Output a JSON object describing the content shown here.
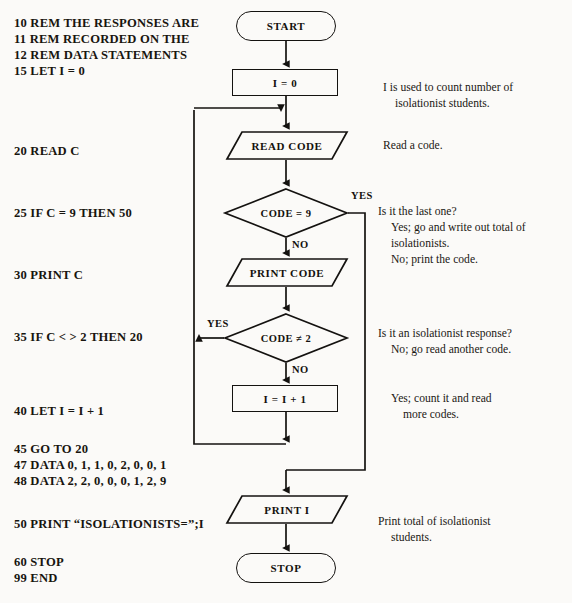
{
  "program": {
    "title": "BASIC program listing",
    "lines": [
      {
        "text": "10 REM THE RESPONSES ARE",
        "x": 14,
        "y": 16
      },
      {
        "text": "11 REM RECORDED ON THE",
        "x": 14,
        "y": 32
      },
      {
        "text": "12 REM DATA STATEMENTS",
        "x": 14,
        "y": 48
      },
      {
        "text": "15 LET I = 0",
        "x": 14,
        "y": 64
      },
      {
        "text": "20  READ C",
        "x": 14,
        "y": 144
      },
      {
        "text": "25 IF C = 9 THEN 50",
        "x": 14,
        "y": 206
      },
      {
        "text": "30 PRINT C",
        "x": 14,
        "y": 268
      },
      {
        "text": "35 IF C < > 2 THEN 20",
        "x": 14,
        "y": 330
      },
      {
        "text": "40 LET I = I + 1",
        "x": 14,
        "y": 404
      },
      {
        "text": "45 GO TO 20",
        "x": 14,
        "y": 442
      },
      {
        "text": "47 DATA 0, 1, 1, 0, 2, 0, 0, 1",
        "x": 14,
        "y": 458
      },
      {
        "text": "48 DATA 2, 2, 0, 0, 0, 1, 2, 9",
        "x": 14,
        "y": 474
      },
      {
        "text": "50 PRINT “ISOLATIONISTS=”;I",
        "x": 14,
        "y": 517
      },
      {
        "text": "60 STOP",
        "x": 14,
        "y": 555
      },
      {
        "text": "99 END",
        "x": 14,
        "y": 571
      }
    ]
  },
  "flowchart": {
    "type": "flowchart",
    "nodes": [
      {
        "id": "start",
        "shape": "terminal",
        "label": "START",
        "x": 236,
        "y": 11,
        "w": 100,
        "h": 30
      },
      {
        "id": "init",
        "shape": "process",
        "label": "I = 0",
        "x": 232,
        "y": 69,
        "w": 106,
        "h": 27
      },
      {
        "id": "read",
        "shape": "io",
        "label": "READ CODE",
        "x": 226,
        "y": 131,
        "w": 122,
        "h": 29
      },
      {
        "id": "dec9",
        "shape": "decision",
        "label": "CODE = 9",
        "x": 224,
        "y": 188,
        "w": 124,
        "h": 50
      },
      {
        "id": "print",
        "shape": "io",
        "label": "PRINT CODE",
        "x": 226,
        "y": 258,
        "w": 122,
        "h": 29
      },
      {
        "id": "dec2",
        "shape": "decision",
        "label": "CODE ≠ 2",
        "x": 224,
        "y": 313,
        "w": 124,
        "h": 50
      },
      {
        "id": "incr",
        "shape": "process",
        "label": "I = I + 1",
        "x": 232,
        "y": 385,
        "w": 106,
        "h": 27
      },
      {
        "id": "printi",
        "shape": "io",
        "label": "PRINT I",
        "x": 226,
        "y": 495,
        "w": 122,
        "h": 29
      },
      {
        "id": "stop",
        "shape": "terminal",
        "label": "STOP",
        "x": 236,
        "y": 553,
        "w": 100,
        "h": 30
      }
    ],
    "branch_labels": [
      {
        "id": "yes-code9",
        "text": "YES",
        "x": 351,
        "y": 190
      },
      {
        "id": "no-code9",
        "text": "NO",
        "x": 253,
        "y": 239
      },
      {
        "id": "yes-code2",
        "text": "YES",
        "x": 213,
        "y": 315
      },
      {
        "id": "no-code2",
        "text": "NO",
        "x": 253,
        "y": 364
      }
    ]
  },
  "annotations": [
    {
      "id": "note-init-1",
      "text": "I is used to count number of",
      "x": 383,
      "y": 81,
      "indent": false
    },
    {
      "id": "note-init-2",
      "text": "isolationist students.",
      "x": 395,
      "y": 97,
      "indent": true
    },
    {
      "id": "note-read",
      "text": "Read a code.",
      "x": 383,
      "y": 139,
      "indent": false
    },
    {
      "id": "note-dec9-1",
      "text": "Is it the last one?",
      "x": 378,
      "y": 205,
      "indent": false
    },
    {
      "id": "note-dec9-2",
      "text": "Yes; go and write out total of",
      "x": 391,
      "y": 221,
      "indent": true
    },
    {
      "id": "note-dec9-3",
      "text": "isolationists.",
      "x": 391,
      "y": 237,
      "indent": true
    },
    {
      "id": "note-dec9-4",
      "text": "No; print the code.",
      "x": 391,
      "y": 253,
      "indent": true
    },
    {
      "id": "note-dec2-1",
      "text": "Is it an isolationist response?",
      "x": 378,
      "y": 327,
      "indent": false
    },
    {
      "id": "note-dec2-2",
      "text": "No; go read another code.",
      "x": 391,
      "y": 343,
      "indent": true
    },
    {
      "id": "note-incr-1",
      "text": "Yes; count it and read",
      "x": 391,
      "y": 392,
      "indent": true
    },
    {
      "id": "note-incr-2",
      "text": "more codes.",
      "x": 403,
      "y": 408,
      "indent": true
    },
    {
      "id": "note-printi-1",
      "text": "Print total of isolationist",
      "x": 378,
      "y": 515,
      "indent": false
    },
    {
      "id": "note-printi-2",
      "text": "students.",
      "x": 391,
      "y": 531,
      "indent": true
    }
  ],
  "colors": {
    "ink": "#141210",
    "paper": "#fbfaf8"
  }
}
